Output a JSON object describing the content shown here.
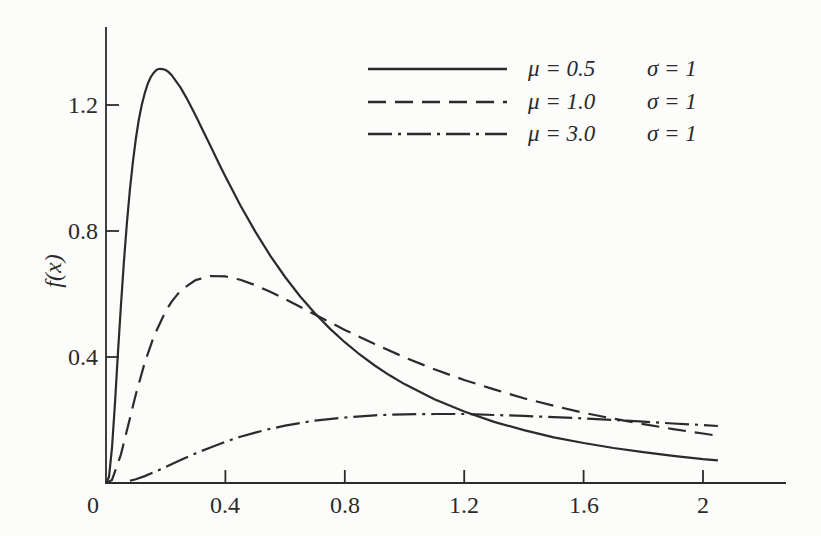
{
  "figure": {
    "background_color": "#fcfcfa",
    "ink_color": "#2b2b2b"
  },
  "chart_data": {
    "type": "line",
    "title": "",
    "xlabel": "",
    "ylabel": "f(x)",
    "xlim": [
      0,
      2.28
    ],
    "ylim": [
      0,
      1.45
    ],
    "grid": false,
    "legend_position": "top-right",
    "origin_label": "0",
    "x_ticks": {
      "values": [
        0.4,
        0.8,
        1.2,
        1.6,
        2.0
      ],
      "labels": [
        "0.4",
        "0.8",
        "1.2",
        "1.6",
        "2"
      ]
    },
    "y_ticks": {
      "values": [
        0.4,
        0.8,
        1.2
      ],
      "labels": [
        "0.4",
        "0.8",
        "1.2"
      ]
    },
    "series": [
      {
        "name": "mu-0.5",
        "label_mu": "μ = 0.5",
        "label_sigma": "σ = 1",
        "mu": 0.5,
        "sigma": 1,
        "style": "solid",
        "points": [
          [
            0,
            0
          ],
          [
            0.01,
            0.019
          ],
          [
            0.02,
            0.112
          ],
          [
            0.03,
            0.254
          ],
          [
            0.04,
            0.411
          ],
          [
            0.05,
            0.562
          ],
          [
            0.06,
            0.702
          ],
          [
            0.07,
            0.825
          ],
          [
            0.08,
            0.931
          ],
          [
            0.09,
            1.019
          ],
          [
            0.1,
            1.092
          ],
          [
            0.11,
            1.153
          ],
          [
            0.12,
            1.201
          ],
          [
            0.13,
            1.238
          ],
          [
            0.14,
            1.268
          ],
          [
            0.15,
            1.289
          ],
          [
            0.16,
            1.303
          ],
          [
            0.17,
            1.312
          ],
          [
            0.18,
            1.315
          ],
          [
            0.19,
            1.314
          ],
          [
            0.2,
            1.311
          ],
          [
            0.21,
            1.304
          ],
          [
            0.22,
            1.295
          ],
          [
            0.25,
            1.255
          ],
          [
            0.27,
            1.222
          ],
          [
            0.3,
            1.167
          ],
          [
            0.33,
            1.109
          ],
          [
            0.35,
            1.07
          ],
          [
            0.38,
            1.011
          ],
          [
            0.4,
            0.973
          ],
          [
            0.45,
            0.882
          ],
          [
            0.5,
            0.798
          ],
          [
            0.55,
            0.722
          ],
          [
            0.6,
            0.654
          ],
          [
            0.65,
            0.593
          ],
          [
            0.7,
            0.539
          ],
          [
            0.75,
            0.49
          ],
          [
            0.8,
            0.447
          ],
          [
            0.85,
            0.408
          ],
          [
            0.9,
            0.373
          ],
          [
            0.95,
            0.342
          ],
          [
            1.0,
            0.314
          ],
          [
            1.1,
            0.266
          ],
          [
            1.2,
            0.227
          ],
          [
            1.3,
            0.194
          ],
          [
            1.4,
            0.168
          ],
          [
            1.5,
            0.145
          ],
          [
            1.6,
            0.127
          ],
          [
            1.7,
            0.111
          ],
          [
            1.8,
            0.098
          ],
          [
            1.9,
            0.086
          ],
          [
            2.0,
            0.076
          ],
          [
            2.05,
            0.072
          ]
        ]
      },
      {
        "name": "mu-1.0",
        "label_mu": "μ = 1.0",
        "label_sigma": "σ = 1",
        "mu": 1.0,
        "sigma": 1,
        "style": "dashed",
        "points": [
          [
            0,
            0
          ],
          [
            0.02,
            0.01
          ],
          [
            0.05,
            0.09
          ],
          [
            0.08,
            0.205
          ],
          [
            0.1,
            0.281
          ],
          [
            0.13,
            0.383
          ],
          [
            0.16,
            0.465
          ],
          [
            0.2,
            0.546
          ],
          [
            0.22,
            0.576
          ],
          [
            0.25,
            0.611
          ],
          [
            0.3,
            0.644
          ],
          [
            0.35,
            0.657
          ],
          [
            0.4,
            0.656
          ],
          [
            0.45,
            0.645
          ],
          [
            0.5,
            0.628
          ],
          [
            0.55,
            0.607
          ],
          [
            0.6,
            0.584
          ],
          [
            0.7,
            0.535
          ],
          [
            0.8,
            0.486
          ],
          [
            0.9,
            0.441
          ],
          [
            1.0,
            0.399
          ],
          [
            1.1,
            0.361
          ],
          [
            1.2,
            0.327
          ],
          [
            1.3,
            0.297
          ],
          [
            1.4,
            0.269
          ],
          [
            1.5,
            0.245
          ],
          [
            1.6,
            0.223
          ],
          [
            1.7,
            0.204
          ],
          [
            1.8,
            0.187
          ],
          [
            1.9,
            0.171
          ],
          [
            2.0,
            0.157
          ],
          [
            2.05,
            0.15
          ]
        ]
      },
      {
        "name": "mu-3.0",
        "label_mu": "μ = 3.0",
        "label_sigma": "σ = 1",
        "mu": 3.0,
        "sigma": 1,
        "style": "dashdot",
        "points": [
          [
            0.08,
            0.007
          ],
          [
            0.1,
            0.012
          ],
          [
            0.13,
            0.022
          ],
          [
            0.16,
            0.034
          ],
          [
            0.2,
            0.051
          ],
          [
            0.25,
            0.073
          ],
          [
            0.3,
            0.094
          ],
          [
            0.35,
            0.113
          ],
          [
            0.4,
            0.131
          ],
          [
            0.45,
            0.147
          ],
          [
            0.5,
            0.16
          ],
          [
            0.55,
            0.172
          ],
          [
            0.6,
            0.182
          ],
          [
            0.7,
            0.198
          ],
          [
            0.8,
            0.208
          ],
          [
            0.9,
            0.215
          ],
          [
            1.0,
            0.218
          ],
          [
            1.1,
            0.219
          ],
          [
            1.2,
            0.219
          ],
          [
            1.3,
            0.216
          ],
          [
            1.4,
            0.213
          ],
          [
            1.5,
            0.209
          ],
          [
            1.6,
            0.205
          ],
          [
            1.7,
            0.2
          ],
          [
            1.8,
            0.195
          ],
          [
            1.9,
            0.189
          ],
          [
            2.0,
            0.184
          ],
          [
            2.05,
            0.181
          ]
        ]
      }
    ]
  }
}
